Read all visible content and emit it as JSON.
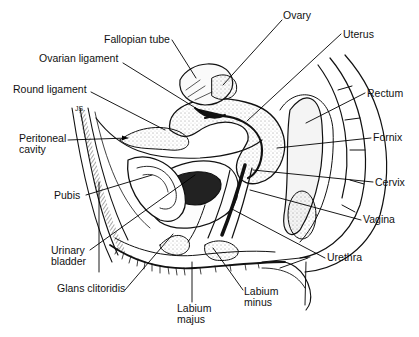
{
  "diagram": {
    "type": "anatomical line drawing",
    "artist_initials": "JS",
    "labels": [
      {
        "id": "ovary",
        "text": "Ovary",
        "x": 283,
        "y": 10
      },
      {
        "id": "fallopian-tube",
        "text": "Fallopian tube",
        "x": 104,
        "y": 34
      },
      {
        "id": "uterus",
        "text": "Uterus",
        "x": 343,
        "y": 29
      },
      {
        "id": "ovarian-ligament",
        "text": "Ovarian ligament",
        "x": 39,
        "y": 53
      },
      {
        "id": "round-ligament",
        "text": "Round ligament",
        "x": 13,
        "y": 84
      },
      {
        "id": "rectum",
        "text": "Rectum",
        "x": 367,
        "y": 88
      },
      {
        "id": "peritoneal-cavity",
        "text": "Peritoneal\ncavity",
        "x": 19,
        "y": 133
      },
      {
        "id": "fornix",
        "text": "Fornix",
        "x": 373,
        "y": 132
      },
      {
        "id": "pubis",
        "text": "Pubis",
        "x": 54,
        "y": 190
      },
      {
        "id": "cervix",
        "text": "Cervix",
        "x": 375,
        "y": 177
      },
      {
        "id": "vagina",
        "text": "Vagina",
        "x": 363,
        "y": 214
      },
      {
        "id": "urinary-bladder",
        "text": "Urinary\nbladder",
        "x": 51,
        "y": 245
      },
      {
        "id": "urethra",
        "text": "Urethra",
        "x": 327,
        "y": 252
      },
      {
        "id": "glans-clitoridis",
        "text": "Glans clitoridis",
        "x": 57,
        "y": 283
      },
      {
        "id": "labium-minus",
        "text": "Labium\nminus",
        "x": 244,
        "y": 286
      },
      {
        "id": "labium-majus",
        "text": "Labium\nmajus",
        "x": 177,
        "y": 303
      }
    ],
    "leader_lines": [
      {
        "to": "ovary",
        "x1": 282,
        "y1": 20,
        "x2": 223,
        "y2": 85
      },
      {
        "to": "fallopian-tube",
        "x1": 172,
        "y1": 40,
        "x2": 196,
        "y2": 78
      },
      {
        "to": "uterus",
        "x1": 341,
        "y1": 34,
        "x2": 247,
        "y2": 121
      },
      {
        "to": "ovarian-ligament",
        "x1": 123,
        "y1": 63,
        "x2": 202,
        "y2": 112
      },
      {
        "to": "round-ligament",
        "x1": 91,
        "y1": 92,
        "x2": 165,
        "y2": 130
      },
      {
        "to": "rectum",
        "x1": 365,
        "y1": 93,
        "x2": 306,
        "y2": 123
      },
      {
        "to": "peritoneal-cavity",
        "x1": 68,
        "y1": 140,
        "x2": 128,
        "y2": 138
      },
      {
        "to": "fornix",
        "x1": 371,
        "y1": 138,
        "x2": 277,
        "y2": 148
      },
      {
        "to": "pubis",
        "x1": 86,
        "y1": 195,
        "x2": 152,
        "y2": 175
      },
      {
        "to": "cervix",
        "x1": 373,
        "y1": 182,
        "x2": 253,
        "y2": 170
      },
      {
        "to": "vagina",
        "x1": 361,
        "y1": 220,
        "x2": 250,
        "y2": 190
      },
      {
        "to": "urinary-bladder",
        "x1": 90,
        "y1": 250,
        "x2": 195,
        "y2": 175
      },
      {
        "to": "urethra",
        "x1": 325,
        "y1": 258,
        "x2": 232,
        "y2": 209
      },
      {
        "to": "glans-clitoridis",
        "x1": 125,
        "y1": 290,
        "x2": 173,
        "y2": 234
      },
      {
        "to": "labium-minus",
        "x1": 243,
        "y1": 290,
        "x2": 213,
        "y2": 248
      },
      {
        "to": "labium-majus",
        "x1": 192,
        "y1": 302,
        "x2": 192,
        "y2": 262
      },
      {
        "to": "pubis-skin-edge",
        "x1": 99,
        "y1": 182,
        "x2": 99,
        "y2": 272
      }
    ]
  }
}
